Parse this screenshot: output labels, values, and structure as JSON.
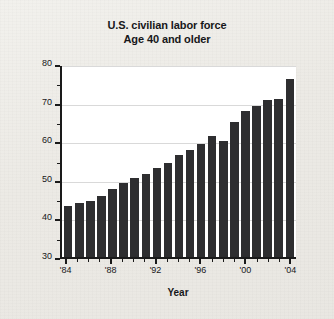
{
  "chart_data": {
    "type": "bar",
    "title": "U.S. civilian labor force",
    "subtitle": "Age 40 and older",
    "xlabel": "Year",
    "ylabel": "Workers in the United States (millions)",
    "ylim": [
      30,
      80
    ],
    "ytick_step": 10,
    "yminor_step": 5,
    "grid": true,
    "legend": null,
    "bar_color": "#2e2e30",
    "categories": [
      "1984",
      "1985",
      "1986",
      "1987",
      "1988",
      "1989",
      "1990",
      "1991",
      "1992",
      "1993",
      "1994",
      "1995",
      "1996",
      "1997",
      "1998",
      "1999",
      "2000",
      "2001",
      "2002",
      "2003",
      "2004"
    ],
    "values": [
      43.1,
      44.0,
      44.6,
      45.9,
      47.5,
      49.2,
      50.4,
      51.5,
      53.1,
      54.4,
      56.3,
      57.7,
      59.4,
      61.4,
      60.1,
      65.0,
      67.8,
      69.1,
      70.7,
      70.9,
      76.0
    ],
    "ytick_labels": [
      "80",
      "70",
      "60",
      "50",
      "40",
      "30"
    ],
    "ytick_values": [
      80,
      70,
      60,
      50,
      40,
      30
    ],
    "yminor_values": [
      75,
      65,
      55,
      45,
      35
    ],
    "xtick_labels": [
      "'84",
      "'88",
      "'92",
      "'96",
      "'00",
      "'04"
    ],
    "xtick_categories": [
      "1984",
      "1988",
      "1992",
      "1996",
      "2000",
      "2004"
    ]
  }
}
